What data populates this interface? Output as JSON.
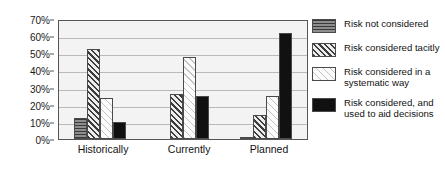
{
  "chart_data": {
    "type": "bar",
    "title": "",
    "xlabel": "",
    "ylabel": "",
    "categories": [
      "Historically",
      "Currently",
      "Planned"
    ],
    "ylim": [
      0,
      70
    ],
    "ytick_labels": [
      "70%",
      "60%",
      "50%",
      "40%",
      "30%",
      "20%",
      "10%",
      "0%"
    ],
    "ytick_values": [
      70,
      60,
      50,
      40,
      30,
      20,
      10,
      0
    ],
    "grid": true,
    "legend_position": "right",
    "series": [
      {
        "name": "Risk not considered",
        "pattern": "horizontal-lines-gray",
        "values": [
          12.5,
          0,
          1
        ]
      },
      {
        "name": "Risk considered tacitly",
        "pattern": "dense-diagonal-dark",
        "values": [
          52.5,
          26,
          14
        ]
      },
      {
        "name": "Risk considered in a systematic way",
        "pattern": "light-diagonal",
        "values": [
          24,
          48,
          25
        ]
      },
      {
        "name": "Risk considered, and used to aid decisions",
        "pattern": "solid-black",
        "values": [
          10,
          25,
          62
        ]
      }
    ]
  },
  "legend": {
    "items": [
      {
        "label": "Risk not considered"
      },
      {
        "label": "Risk considered tacitly"
      },
      {
        "label": "Risk considered in a systematic way"
      },
      {
        "label": "Risk considered, and used to aid decisions"
      }
    ]
  },
  "colors": {
    "plot_background": "#f3f3f3",
    "gridline": "#b9b9b9",
    "axis": "#555555",
    "text": "#111111",
    "series_1": "#8e8e8e",
    "series_2": "#3c3c3c",
    "series_3": "#f0f0f0",
    "series_4": "#111111"
  }
}
